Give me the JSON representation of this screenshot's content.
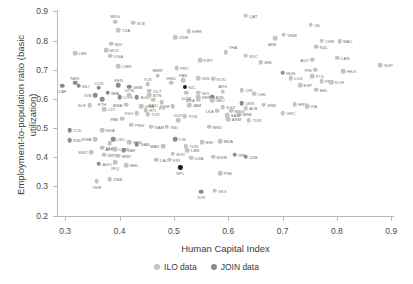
{
  "chart_data": {
    "type": "scatter",
    "title": "",
    "xlabel": "Human Capital Index",
    "ylabel": "Employment-to-population ratio (basic utilization)",
    "xlim": [
      0.285,
      0.905
    ],
    "ylim": [
      0.195,
      0.905
    ],
    "xticks": [
      "0.3",
      "0.4",
      "0.5",
      "0.6",
      "0.7",
      "0.8",
      "0.9"
    ],
    "xtickvals": [
      0.3,
      0.4,
      0.5,
      0.6,
      0.7,
      0.8,
      0.9
    ],
    "yticks": [
      "0.2",
      "0.3",
      "0.4",
      "0.5",
      "0.6",
      "0.7",
      "0.8",
      "0.9"
    ],
    "ytickvals": [
      0.2,
      0.3,
      0.4,
      0.5,
      0.6,
      0.7,
      0.8,
      0.9
    ],
    "grid": false,
    "legend_position": "bottom-center",
    "series": [
      {
        "name": "ILO data",
        "key": "ilo",
        "color": "#c3c3c3"
      },
      {
        "name": "JOIN data",
        "key": "join",
        "color": "#8b8b8b"
      }
    ],
    "points": [
      {
        "label": "MDG",
        "x": 0.392,
        "y": 0.865,
        "s": "ilo",
        "lp": "tl"
      },
      {
        "label": "SLB",
        "x": 0.425,
        "y": 0.862,
        "s": "ilo",
        "lp": "r"
      },
      {
        "label": "TZA",
        "x": 0.398,
        "y": 0.836,
        "s": "ilo",
        "lp": "r"
      },
      {
        "label": "KHM",
        "x": 0.527,
        "y": 0.833,
        "s": "ilo",
        "lp": "r"
      },
      {
        "label": "ZWE",
        "x": 0.503,
        "y": 0.812,
        "s": "ilo",
        "lp": "r"
      },
      {
        "label": "BDI",
        "x": 0.385,
        "y": 0.79,
        "s": "ilo",
        "lp": "r"
      },
      {
        "label": "MOZ",
        "x": 0.375,
        "y": 0.768,
        "s": "ilo",
        "lp": "r"
      },
      {
        "label": "LBR",
        "x": 0.318,
        "y": 0.757,
        "s": "ilo",
        "lp": "r"
      },
      {
        "label": "UGA",
        "x": 0.383,
        "y": 0.748,
        "s": "ilo",
        "lp": "r"
      },
      {
        "label": "CMR",
        "x": 0.398,
        "y": 0.712,
        "s": "ilo",
        "lp": "r"
      },
      {
        "label": "QAT",
        "x": 0.632,
        "y": 0.885,
        "s": "ilo",
        "lp": "r"
      },
      {
        "label": "ISL",
        "x": 0.752,
        "y": 0.855,
        "s": "ilo",
        "lp": "r"
      },
      {
        "label": "VNM",
        "x": 0.702,
        "y": 0.82,
        "s": "ilo",
        "lp": "r"
      },
      {
        "label": "ARE",
        "x": 0.686,
        "y": 0.808,
        "s": "ilo",
        "lp": "bl"
      },
      {
        "label": "CHE",
        "x": 0.772,
        "y": 0.8,
        "s": "ilo",
        "lp": "r"
      },
      {
        "label": "MAC",
        "x": 0.805,
        "y": 0.798,
        "s": "ilo",
        "lp": "r"
      },
      {
        "label": "NZL",
        "x": 0.762,
        "y": 0.779,
        "s": "ilo",
        "lp": "r"
      },
      {
        "label": "THA",
        "x": 0.595,
        "y": 0.76,
        "s": "ilo",
        "lp": "tr"
      },
      {
        "label": "SYC",
        "x": 0.632,
        "y": 0.748,
        "s": "ilo",
        "lp": "r"
      },
      {
        "label": "KWT",
        "x": 0.548,
        "y": 0.732,
        "s": "ilo",
        "lp": "r"
      },
      {
        "label": "BHL",
        "x": 0.66,
        "y": 0.726,
        "s": "ilo",
        "lp": "r"
      },
      {
        "label": "AUT",
        "x": 0.755,
        "y": 0.735,
        "s": "ilo",
        "lp": "l"
      },
      {
        "label": "CAN",
        "x": 0.8,
        "y": 0.742,
        "s": "ilo",
        "lp": "r"
      },
      {
        "label": "PRY",
        "x": 0.505,
        "y": 0.705,
        "s": "ilo",
        "lp": "r"
      },
      {
        "label": "IDN",
        "x": 0.545,
        "y": 0.672,
        "s": "ilo",
        "lp": "r"
      },
      {
        "label": "ROU",
        "x": 0.572,
        "y": 0.67,
        "s": "ilo",
        "lp": "r"
      },
      {
        "label": "HUN",
        "x": 0.7,
        "y": 0.69,
        "s": "join",
        "lp": "r"
      },
      {
        "label": "LUX",
        "x": 0.715,
        "y": 0.672,
        "s": "ilo",
        "lp": "r"
      },
      {
        "label": "FIN",
        "x": 0.76,
        "y": 0.7,
        "s": "ilo",
        "lp": "l"
      },
      {
        "label": "HKG",
        "x": 0.812,
        "y": 0.695,
        "s": "ilo",
        "lp": "r"
      },
      {
        "label": "POL",
        "x": 0.755,
        "y": 0.678,
        "s": "ilo",
        "lp": "r"
      },
      {
        "label": "FRA",
        "x": 0.772,
        "y": 0.66,
        "s": "ilo",
        "lp": "r"
      },
      {
        "label": "KOR",
        "x": 0.79,
        "y": 0.658,
        "s": "ilo",
        "lp": "r"
      },
      {
        "label": "ESP",
        "x": 0.732,
        "y": 0.648,
        "s": "ilo",
        "lp": "r"
      },
      {
        "label": "BEL",
        "x": 0.762,
        "y": 0.632,
        "s": "ilo",
        "lp": "r"
      },
      {
        "label": "SGP",
        "x": 0.88,
        "y": 0.715,
        "s": "ilo",
        "lp": "r"
      },
      {
        "label": "NER",
        "x": 0.318,
        "y": 0.655,
        "s": "join",
        "lp": "tl"
      },
      {
        "label": "MLI",
        "x": 0.325,
        "y": 0.645,
        "s": "join",
        "lp": "r"
      },
      {
        "label": "CAF",
        "x": 0.295,
        "y": 0.645,
        "s": "join",
        "lp": "b"
      },
      {
        "label": "COD",
        "x": 0.362,
        "y": 0.638,
        "s": "join",
        "lp": "tl"
      },
      {
        "label": "SEN",
        "x": 0.398,
        "y": 0.648,
        "s": "join",
        "lp": "tl"
      },
      {
        "label": "GMB",
        "x": 0.418,
        "y": 0.642,
        "s": "join",
        "lp": "r"
      },
      {
        "label": "TLS",
        "x": 0.452,
        "y": 0.65,
        "s": "ilo",
        "lp": "tl"
      },
      {
        "label": "MMR",
        "x": 0.47,
        "y": 0.68,
        "s": "ilo",
        "lp": "tl"
      },
      {
        "label": "PAN",
        "x": 0.517,
        "y": 0.665,
        "s": "ilo",
        "lp": "tl"
      },
      {
        "label": "NIC",
        "x": 0.52,
        "y": 0.64,
        "s": "blk",
        "lp": "r"
      },
      {
        "label": "DOM",
        "x": 0.523,
        "y": 0.622,
        "s": "ilo",
        "lp": "b"
      },
      {
        "label": "SLV",
        "x": 0.545,
        "y": 0.622,
        "s": "ilo",
        "lp": "r"
      },
      {
        "label": "VUT",
        "x": 0.455,
        "y": 0.628,
        "s": "ilo",
        "lp": "r"
      },
      {
        "label": "HND",
        "x": 0.495,
        "y": 0.655,
        "s": "ilo",
        "lp": "tl"
      },
      {
        "label": "BFA",
        "x": 0.378,
        "y": 0.622,
        "s": "join",
        "lp": "r"
      },
      {
        "label": "GIN",
        "x": 0.355,
        "y": 0.612,
        "s": "join",
        "lp": "l"
      },
      {
        "label": "ETH",
        "x": 0.368,
        "y": 0.6,
        "s": "join",
        "lp": "b"
      },
      {
        "label": "COG",
        "x": 0.4,
        "y": 0.605,
        "s": "join",
        "lp": "r"
      },
      {
        "label": "GTM",
        "x": 0.418,
        "y": 0.613,
        "s": "ilo",
        "lp": "tl"
      },
      {
        "label": "BGD",
        "x": 0.432,
        "y": 0.605,
        "s": "join",
        "lp": "r"
      },
      {
        "label": "BTN",
        "x": 0.455,
        "y": 0.612,
        "s": "ilo",
        "lp": "r"
      },
      {
        "label": "NRU",
        "x": 0.462,
        "y": 0.598,
        "s": "ilo",
        "lp": "b"
      },
      {
        "label": "KEN",
        "x": 0.545,
        "y": 0.605,
        "s": "ilo",
        "lp": "r"
      },
      {
        "label": "AZE",
        "x": 0.57,
        "y": 0.605,
        "s": "join",
        "lp": "r"
      },
      {
        "label": "ARG",
        "x": 0.59,
        "y": 0.625,
        "s": "ilo",
        "lp": "tl"
      },
      {
        "label": "CRI",
        "x": 0.625,
        "y": 0.63,
        "s": "ilo",
        "lp": "r"
      },
      {
        "label": "CHL",
        "x": 0.648,
        "y": 0.618,
        "s": "ilo",
        "lp": "r"
      },
      {
        "label": "SLE",
        "x": 0.345,
        "y": 0.578,
        "s": "ilo",
        "lp": "l"
      },
      {
        "label": "CIV",
        "x": 0.372,
        "y": 0.565,
        "s": "ilo",
        "lp": "r"
      },
      {
        "label": "BWA",
        "x": 0.412,
        "y": 0.58,
        "s": "ilo",
        "lp": "l"
      },
      {
        "label": "GHA",
        "x": 0.44,
        "y": 0.575,
        "s": "ilo",
        "lp": "r"
      },
      {
        "label": "HTI",
        "x": 0.448,
        "y": 0.562,
        "s": "ilo",
        "lp": "r"
      },
      {
        "label": "FJI",
        "x": 0.478,
        "y": 0.588,
        "s": "ilo",
        "lp": "b"
      },
      {
        "label": "FSM",
        "x": 0.498,
        "y": 0.575,
        "s": "ilo",
        "lp": "l"
      },
      {
        "label": "JAM",
        "x": 0.528,
        "y": 0.578,
        "s": "ilo",
        "lp": "r"
      },
      {
        "label": "BRA",
        "x": 0.545,
        "y": 0.598,
        "s": "ilo",
        "lp": "l"
      },
      {
        "label": "GEO",
        "x": 0.57,
        "y": 0.595,
        "s": "ilo",
        "lp": "r"
      },
      {
        "label": "KGZ",
        "x": 0.59,
        "y": 0.572,
        "s": "ilo",
        "lp": "r"
      },
      {
        "label": "LKA",
        "x": 0.58,
        "y": 0.56,
        "s": "ilo",
        "lp": "l"
      },
      {
        "label": "MNG",
        "x": 0.605,
        "y": 0.56,
        "s": "ilo",
        "lp": "r"
      },
      {
        "label": "ALB",
        "x": 0.632,
        "y": 0.568,
        "s": "ilo",
        "lp": "r"
      },
      {
        "label": "UKR",
        "x": 0.625,
        "y": 0.585,
        "s": "join",
        "lp": "r"
      },
      {
        "label": "SRB",
        "x": 0.665,
        "y": 0.58,
        "s": "ilo",
        "lp": "r"
      },
      {
        "label": "HRV",
        "x": 0.722,
        "y": 0.582,
        "s": "ilo",
        "lp": "r"
      },
      {
        "label": "ITA",
        "x": 0.745,
        "y": 0.575,
        "s": "ilo",
        "lp": "r"
      },
      {
        "label": "MNE",
        "x": 0.62,
        "y": 0.548,
        "s": "ilo",
        "lp": "r"
      },
      {
        "label": "GRC",
        "x": 0.7,
        "y": 0.552,
        "s": "ilo",
        "lp": "r"
      },
      {
        "label": "SAU",
        "x": 0.598,
        "y": 0.545,
        "s": "ilo",
        "lp": "r"
      },
      {
        "label": "ARM",
        "x": 0.6,
        "y": 0.53,
        "s": "ilo",
        "lp": "r"
      },
      {
        "label": "TUR",
        "x": 0.638,
        "y": 0.528,
        "s": "ilo",
        "lp": "r"
      },
      {
        "label": "TGO",
        "x": 0.432,
        "y": 0.552,
        "s": "ilo",
        "lp": "l"
      },
      {
        "label": "TUV",
        "x": 0.452,
        "y": 0.548,
        "s": "ilo",
        "lp": "r"
      },
      {
        "label": "TON",
        "x": 0.52,
        "y": 0.54,
        "s": "ilo",
        "lp": "r"
      },
      {
        "label": "GUY",
        "x": 0.508,
        "y": 0.528,
        "s": "ilo",
        "lp": "tl"
      },
      {
        "label": "PAK",
        "x": 0.405,
        "y": 0.532,
        "s": "ilo",
        "lp": "l"
      },
      {
        "label": "PNG",
        "x": 0.422,
        "y": 0.512,
        "s": "ilo",
        "lp": "r"
      },
      {
        "label": "NAM",
        "x": 0.458,
        "y": 0.505,
        "s": "ilo",
        "lp": "r"
      },
      {
        "label": "IND",
        "x": 0.487,
        "y": 0.505,
        "s": "ilo",
        "lp": "r"
      },
      {
        "label": "MKD",
        "x": 0.565,
        "y": 0.505,
        "s": "ilo",
        "lp": "r"
      },
      {
        "label": "NGA",
        "x": 0.368,
        "y": 0.492,
        "s": "ilo",
        "lp": "r"
      },
      {
        "label": "RWA",
        "x": 0.355,
        "y": 0.462,
        "s": "ilo",
        "lp": "l"
      },
      {
        "label": "TCD",
        "x": 0.308,
        "y": 0.492,
        "s": "join",
        "lp": "r"
      },
      {
        "label": "SSD",
        "x": 0.308,
        "y": 0.458,
        "s": "join",
        "lp": "r"
      },
      {
        "label": "LSO",
        "x": 0.388,
        "y": 0.462,
        "s": "join",
        "lp": "r"
      },
      {
        "label": "SEN2",
        "x": 0.418,
        "y": 0.452,
        "s": "ilo",
        "lp": "r"
      },
      {
        "label": "GAB",
        "x": 0.432,
        "y": 0.445,
        "s": "join",
        "lp": "r"
      },
      {
        "label": "AFG",
        "x": 0.382,
        "y": 0.448,
        "s": "ilo",
        "lp": "b"
      },
      {
        "label": "TJK",
        "x": 0.502,
        "y": 0.462,
        "s": "join",
        "lp": "r"
      },
      {
        "label": "BIH",
        "x": 0.552,
        "y": 0.452,
        "s": "ilo",
        "lp": "r"
      },
      {
        "label": "MDA",
        "x": 0.585,
        "y": 0.455,
        "s": "ilo",
        "lp": "r"
      },
      {
        "label": "MAR",
        "x": 0.48,
        "y": 0.438,
        "s": "ilo",
        "lp": "l"
      },
      {
        "label": "TUN",
        "x": 0.522,
        "y": 0.438,
        "s": "ilo",
        "lp": "r"
      },
      {
        "label": "LBN",
        "x": 0.525,
        "y": 0.425,
        "s": "ilo",
        "lp": "r"
      },
      {
        "label": "SDN",
        "x": 0.368,
        "y": 0.432,
        "s": "ilo",
        "lp": "r"
      },
      {
        "label": "COM",
        "x": 0.392,
        "y": 0.428,
        "s": "ilo",
        "lp": "r"
      },
      {
        "label": "ZAF",
        "x": 0.408,
        "y": 0.425,
        "s": "join",
        "lp": "r"
      },
      {
        "label": "SWZ",
        "x": 0.348,
        "y": 0.418,
        "s": "ilo",
        "lp": "l"
      },
      {
        "label": "MRT",
        "x": 0.372,
        "y": 0.408,
        "s": "ilo",
        "lp": "r"
      },
      {
        "label": "MWI",
        "x": 0.398,
        "y": 0.405,
        "s": "ilo",
        "lp": "r"
      },
      {
        "label": "EGY",
        "x": 0.498,
        "y": 0.412,
        "s": "ilo",
        "lp": "r"
      },
      {
        "label": "DZA",
        "x": 0.532,
        "y": 0.398,
        "s": "ilo",
        "lp": "r"
      },
      {
        "label": "WSM",
        "x": 0.572,
        "y": 0.402,
        "s": "ilo",
        "lp": "r"
      },
      {
        "label": "IRN",
        "x": 0.612,
        "y": 0.408,
        "s": "join",
        "lp": "r"
      },
      {
        "label": "UZB",
        "x": 0.632,
        "y": 0.402,
        "s": "join",
        "lp": "r"
      },
      {
        "label": "IRQ",
        "x": 0.392,
        "y": 0.382,
        "s": "ilo",
        "lp": "b"
      },
      {
        "label": "MHL",
        "x": 0.412,
        "y": 0.372,
        "s": "ilo",
        "lp": "r"
      },
      {
        "label": "AGO",
        "x": 0.362,
        "y": 0.378,
        "s": "join",
        "lp": "r"
      },
      {
        "label": "LAO",
        "x": 0.468,
        "y": 0.392,
        "s": "ilo",
        "lp": "r"
      },
      {
        "label": "KIR",
        "x": 0.492,
        "y": 0.392,
        "s": "ilo",
        "lp": "r"
      },
      {
        "label": "NPL",
        "x": 0.512,
        "y": 0.365,
        "s": "blk",
        "lp": "b"
      },
      {
        "label": "ZMB",
        "x": 0.382,
        "y": 0.325,
        "s": "ilo",
        "lp": "r"
      },
      {
        "label": "YEM",
        "x": 0.358,
        "y": 0.318,
        "s": "ilo",
        "lp": "b"
      },
      {
        "label": "PSE",
        "x": 0.585,
        "y": 0.345,
        "s": "ilo",
        "lp": "r"
      },
      {
        "label": "JOR",
        "x": 0.55,
        "y": 0.282,
        "s": "join",
        "lp": "b"
      },
      {
        "label": "XKX",
        "x": 0.575,
        "y": 0.285,
        "s": "ilo",
        "lp": "r"
      }
    ]
  }
}
